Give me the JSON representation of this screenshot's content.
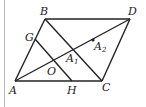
{
  "diagram": {
    "type": "geometry",
    "points": {
      "A": {
        "label": "A",
        "x": 15,
        "y": 81
      },
      "B": {
        "label": "B",
        "x": 45,
        "y": 19
      },
      "C": {
        "label": "C",
        "x": 102,
        "y": 81
      },
      "D": {
        "label": "D",
        "x": 130,
        "y": 19
      },
      "G": {
        "label": "G",
        "x": 35,
        "y": 39
      },
      "H": {
        "label": "H",
        "x": 72,
        "y": 81
      },
      "O": {
        "label": "O",
        "x": 54,
        "y": 62
      },
      "A1": {
        "label": "A",
        "sub": "1",
        "x": 74,
        "y": 51
      },
      "A2": {
        "label": "A",
        "sub": "2",
        "x": 93,
        "y": 40
      }
    },
    "segments": [
      [
        "A",
        "B"
      ],
      [
        "B",
        "D"
      ],
      [
        "D",
        "C"
      ],
      [
        "C",
        "A"
      ],
      [
        "A",
        "D"
      ],
      [
        "B",
        "C"
      ],
      [
        "G",
        "H"
      ]
    ]
  }
}
